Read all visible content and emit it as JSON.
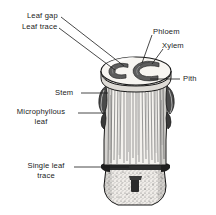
{
  "figure": {
    "background_color": "#ffffff",
    "ink_color": "#1a1a1a",
    "vascular_color": "#5d5d5d",
    "leaf_base_color": "#3d3d3d",
    "cut_surface_color": "#f2f0ec",
    "width": 216,
    "height": 215
  },
  "labels": {
    "leaf_gap": "Leaf gap",
    "leaf_trace": "Leaf trace",
    "phloem": "Phloem",
    "xylem": "Xylem",
    "pith": "Pith",
    "stem": "Stem",
    "microphyllous_leaf_line1": "Microphyllous",
    "microphyllous_leaf_line2": "leaf",
    "single_leaf_trace_line1": "Single leaf",
    "single_leaf_trace_line2": "trace"
  },
  "structures": {
    "cross_section": "elliptical cut surface at stem apex",
    "bundle_left": "C-shaped vascular bundle (left)",
    "bundle_right": "C-shaped vascular bundle (right)",
    "stem_body": "vertically striated stem",
    "node": "node with single leaf trace",
    "base": "stippled stem base"
  }
}
